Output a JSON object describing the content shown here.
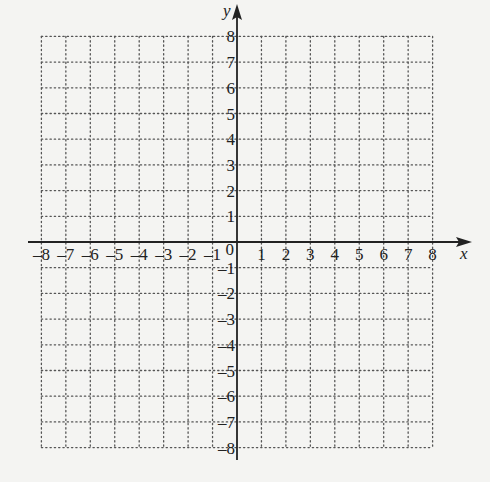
{
  "chart_data": {
    "type": "coordinate-grid",
    "title": "",
    "xlabel": "x",
    "ylabel": "y",
    "xlim": [
      -8,
      8
    ],
    "ylim": [
      -8,
      8
    ],
    "grid": "dotted",
    "x_ticks": [
      -8,
      -7,
      -6,
      -5,
      -4,
      -3,
      -2,
      -1,
      1,
      2,
      3,
      4,
      5,
      6,
      7,
      8
    ],
    "y_ticks": [
      8,
      7,
      6,
      5,
      4,
      3,
      2,
      1,
      -1,
      -2,
      -3,
      -4,
      -5,
      -6,
      -7,
      -8
    ],
    "origin_label": "0",
    "series": []
  },
  "axes": {
    "x_name": "x",
    "y_name": "y",
    "origin": "0"
  },
  "colors": {
    "background": "#f4f4f2",
    "axis": "#222222",
    "grid": "#555555"
  }
}
